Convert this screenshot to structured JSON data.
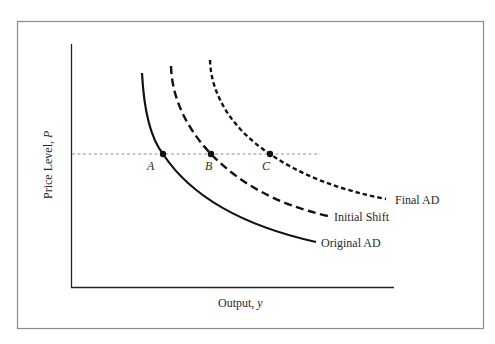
{
  "diagram": {
    "axes": {
      "x_label": "Output, ",
      "x_var": "y",
      "y_label": "Price Level, ",
      "y_var": "P"
    },
    "curves": [
      {
        "id": "original",
        "label": "Original AD",
        "style": "solid"
      },
      {
        "id": "initial",
        "label": "Initial Shift",
        "style": "long-dash"
      },
      {
        "id": "final",
        "label": "Final AD",
        "style": "short-dash"
      }
    ],
    "points": [
      {
        "label": "A",
        "on_curve": "Original AD"
      },
      {
        "label": "B",
        "on_curve": "Initial Shift"
      },
      {
        "label": "C",
        "on_curve": "Final AD"
      }
    ],
    "reference_line": {
      "style": "dotted-horizontal",
      "through": [
        "A",
        "B",
        "C"
      ]
    },
    "colors": {
      "line": "#111111",
      "frame": "#8a8a8a",
      "reference": "#777777",
      "text": "#2a2a2a"
    }
  }
}
